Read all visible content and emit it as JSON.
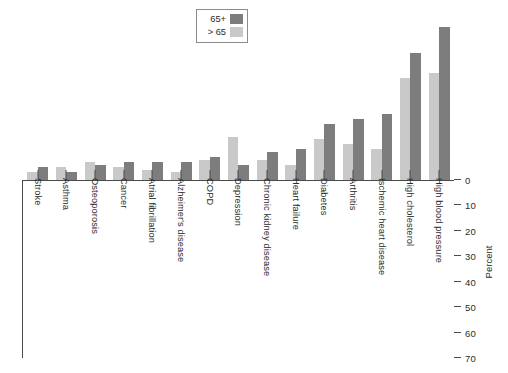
{
  "chart_data": {
    "type": "bar",
    "title": "",
    "xlabel": "",
    "ylabel": "Percent",
    "ylim": [
      0,
      70
    ],
    "yticks": [
      0,
      10,
      20,
      30,
      40,
      50,
      60,
      70
    ],
    "grid": false,
    "legend_position": "top-center",
    "orientation": "inverted-vertical",
    "categories": [
      "Stroke",
      "Asthma",
      "Osteoporosis",
      "Cancer",
      "Atrial fibrillation",
      "Alzheimer's disease",
      "COPD",
      "Depression",
      "Chronic kidney disease",
      "Heart failure",
      "Diabetes",
      "Arthritis",
      "Ischemic heart disease",
      "High cholesterol",
      "High blood pressure"
    ],
    "series": [
      {
        "name": "> 65",
        "color": "#c9c9c9",
        "values": [
          3,
          5,
          7,
          5,
          4,
          3,
          8,
          17,
          8,
          6,
          16,
          14,
          12,
          40,
          42
        ]
      },
      {
        "name": "65+",
        "color": "#7d7d7d",
        "values": [
          5,
          3,
          6,
          7,
          7,
          7,
          9,
          6,
          11,
          12,
          22,
          24,
          26,
          50,
          60
        ]
      }
    ]
  },
  "legend": {
    "items": [
      {
        "label": "> 65",
        "swatch": "light"
      },
      {
        "label": "65+",
        "swatch": "dark"
      }
    ]
  },
  "axis": {
    "y_label": "Percent",
    "y_ticks": [
      "0",
      "10",
      "20",
      "30",
      "40",
      "50",
      "60",
      "70"
    ]
  },
  "colors": {
    "light_bar": "#c9c9c9",
    "dark_bar": "#7d7d7d",
    "axis": "#4a4a4a",
    "text": "#2b2b2b",
    "background": "#ffffff"
  }
}
